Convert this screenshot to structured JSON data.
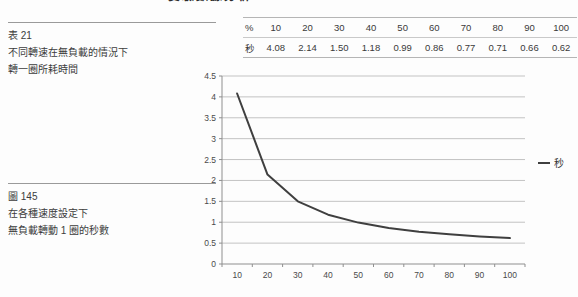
{
  "page_header": {
    "clipped_title": "實驗數據分析"
  },
  "captions": {
    "table_caption": {
      "label": "表 21",
      "line1": "不同轉速在無負載的情況下",
      "line2": "轉一圈所耗時間"
    },
    "figure_caption": {
      "label": "圖 145",
      "line1": "在各種速度設定下",
      "line2": "無負載轉動 1 圈的秒數"
    }
  },
  "data_table": {
    "rows": [
      {
        "header": "%",
        "values": [
          "10",
          "20",
          "30",
          "40",
          "50",
          "60",
          "70",
          "80",
          "90",
          "100"
        ]
      },
      {
        "header": "秒",
        "values": [
          "4.08",
          "2.14",
          "1.50",
          "1.18",
          "0.99",
          "0.86",
          "0.77",
          "0.71",
          "0.66",
          "0.62"
        ]
      }
    ]
  },
  "chart_data": {
    "type": "line",
    "title": "",
    "categories": [
      10,
      20,
      30,
      40,
      50,
      60,
      70,
      80,
      90,
      100
    ],
    "series": [
      {
        "name": "秒",
        "values": [
          4.08,
          2.14,
          1.5,
          1.18,
          0.99,
          0.86,
          0.77,
          0.71,
          0.66,
          0.62
        ]
      }
    ],
    "xlabel": "",
    "ylabel": "",
    "ylim": [
      0,
      4.5
    ],
    "ytick_step": 0.5,
    "grid": true,
    "legend_position": "middle-right",
    "colors": {
      "line": "#3f3f3f",
      "grid": "#c3c3c3",
      "axis": "#8f8f8f",
      "tick_label": "#4a4a4a"
    }
  }
}
